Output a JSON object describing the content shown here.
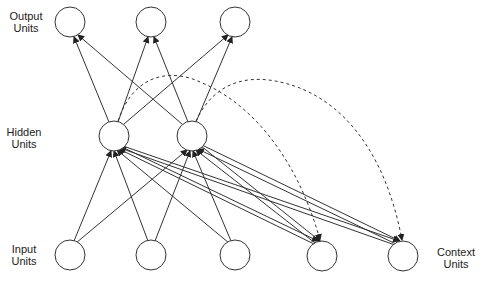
{
  "labels": {
    "output": {
      "line1": "Output",
      "line2": "Units"
    },
    "hidden": {
      "line1": "Hidden",
      "line2": "Units"
    },
    "input": {
      "line1": "Input",
      "line2": "Units"
    },
    "context": {
      "line1": "Context",
      "line2": "Units"
    }
  },
  "nodes": {
    "output": [
      {
        "x": 70,
        "y": 22
      },
      {
        "x": 151,
        "y": 22
      },
      {
        "x": 235,
        "y": 22
      }
    ],
    "hidden": [
      {
        "x": 114,
        "y": 136
      },
      {
        "x": 192,
        "y": 136
      }
    ],
    "input": [
      {
        "x": 70,
        "y": 255
      },
      {
        "x": 151,
        "y": 255
      },
      {
        "x": 235,
        "y": 255
      }
    ],
    "context": [
      {
        "x": 322,
        "y": 256
      },
      {
        "x": 403,
        "y": 256
      }
    ]
  },
  "colors": {
    "stroke": "#333333"
  }
}
